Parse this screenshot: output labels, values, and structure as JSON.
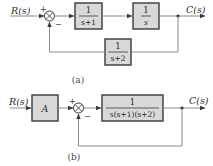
{
  "diagram_a": {
    "input_label": "R(s)",
    "output_label": "C(s)",
    "sum_plus": "+",
    "sum_minus": "−",
    "forward_blocks": [
      {
        "numerator": "1",
        "denominator": "s+1"
      },
      {
        "numerator": "1",
        "denominator": "s"
      }
    ],
    "feedback_block": {
      "numerator": "1",
      "denominator": "s+2"
    },
    "caption": "(a)"
  },
  "diagram_b": {
    "input_label": "R(s)",
    "output_label": "C(s)",
    "gain_block": "A",
    "sum_plus": "+",
    "sum_minus": "−",
    "forward_block": {
      "numerator": "1",
      "denominator": "s(s+1)(s+2)"
    },
    "caption": "(b)"
  },
  "colors": {
    "block_fill": "#d9d9d9",
    "block_border": "#3a3a3a",
    "signal_line": "#8a8a8a"
  }
}
